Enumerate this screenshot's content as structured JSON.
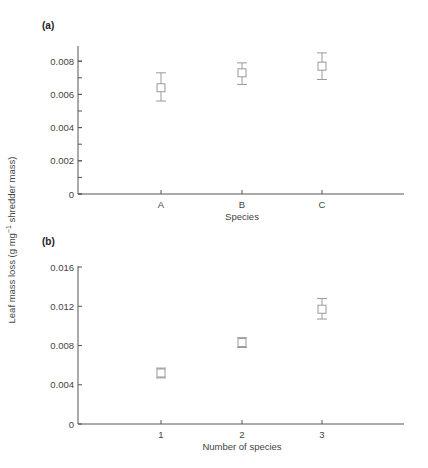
{
  "figure": {
    "ylabel_main": "Leaf mass loss (g mg",
    "ylabel_sup": "−1",
    "ylabel_tail": " shredder mass)"
  },
  "chart_data": [
    {
      "panel": "(a)",
      "type": "scatter",
      "title": "(a)",
      "xlabel": "Species",
      "ylabel": "Leaf mass loss (g mg−1 shredder mass)",
      "categories": [
        "A",
        "B",
        "C"
      ],
      "values": [
        0.0064,
        0.0073,
        0.0077
      ],
      "error_low": [
        0.0056,
        0.0066,
        0.0069
      ],
      "error_high": [
        0.0073,
        0.0079,
        0.0085
      ],
      "ylim": [
        0,
        0.009
      ],
      "yticks": [
        "0",
        "0.002",
        "0.004",
        "0.006",
        "0.008"
      ],
      "ytick_values": [
        0,
        0.002,
        0.004,
        0.006,
        0.008
      ],
      "minor_tick_step": 0.001,
      "grid": false,
      "marker": "open-square",
      "color": "#999999"
    },
    {
      "panel": "(b)",
      "type": "scatter",
      "title": "(b)",
      "xlabel": "Number of species",
      "ylabel": "Leaf mass loss (g mg−1 shredder mass)",
      "categories": [
        "1",
        "2",
        "3"
      ],
      "values": [
        0.0052,
        0.0083,
        0.0117
      ],
      "error_low": [
        0.0047,
        0.0078,
        0.0107
      ],
      "error_high": [
        0.0057,
        0.0088,
        0.0128
      ],
      "ylim": [
        0,
        0.016
      ],
      "yticks": [
        "0",
        "0.004",
        "0.008",
        "0.012",
        "0.016"
      ],
      "ytick_values": [
        0,
        0.004,
        0.008,
        0.012,
        0.016
      ],
      "grid": false,
      "marker": "open-square",
      "color": "#999999"
    }
  ]
}
